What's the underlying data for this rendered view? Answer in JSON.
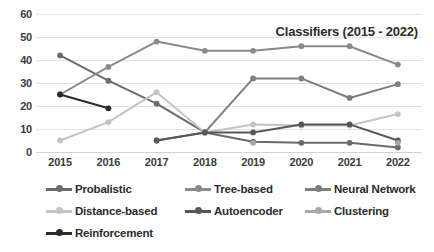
{
  "chart_data": {
    "type": "line",
    "title": "Classifiers (2015 - 2022)",
    "xlabel": "",
    "ylabel": "",
    "categories": [
      "2015",
      "2016",
      "2017",
      "2018",
      "2019",
      "2020",
      "2021",
      "2022"
    ],
    "ylim": [
      0,
      60
    ],
    "yticks": [
      0,
      10,
      20,
      30,
      40,
      50,
      60
    ],
    "grid": "horizontal",
    "legend_position": "bottom",
    "series": [
      {
        "name": "Probalistic",
        "color": "#6b6b6b",
        "values": [
          42,
          31,
          21,
          8.5,
          4.5,
          4,
          4,
          2
        ]
      },
      {
        "name": "Tree-based",
        "color": "#8a8a8a",
        "values": [
          25,
          37,
          48,
          44,
          44,
          46,
          46,
          38
        ]
      },
      {
        "name": "Neural Network",
        "color": "#7e7e7e",
        "values": [
          null,
          null,
          5,
          8.5,
          32,
          32,
          23.5,
          29.5
        ]
      },
      {
        "name": "Distance-based",
        "color": "#c4c4c4",
        "values": [
          5,
          13,
          26,
          8.5,
          12,
          11.5,
          11.5,
          16.5
        ]
      },
      {
        "name": "Autoencoder",
        "color": "#575757",
        "values": [
          null,
          null,
          5,
          8.5,
          8.5,
          12,
          12,
          5
        ]
      },
      {
        "name": "Clustering",
        "color": "#a8a8a8",
        "values": [
          null,
          null,
          null,
          null,
          4,
          null,
          null,
          4
        ]
      },
      {
        "name": "Reinforcement",
        "color": "#2b2b2b",
        "values": [
          25,
          19,
          null,
          null,
          null,
          null,
          null,
          null
        ]
      }
    ]
  },
  "legend": {
    "rows": [
      [
        "Probalistic",
        "Tree-based",
        "Neural Network"
      ],
      [
        "Distance-based",
        "Autoencoder",
        "Clustering"
      ],
      [
        "Reinforcement"
      ]
    ]
  }
}
